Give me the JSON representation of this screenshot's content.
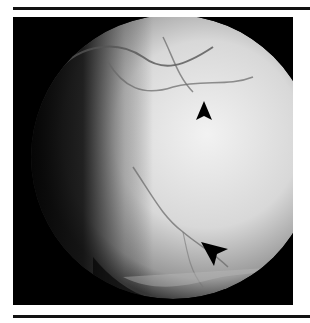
{
  "figure": {
    "type": "grayscale fundus photograph",
    "markers": [
      {
        "name": "arrowhead-upper",
        "direction": "up",
        "x": 204,
        "y": 104
      },
      {
        "name": "arrowhead-lower",
        "direction": "down-right",
        "x": 214,
        "y": 250
      }
    ],
    "colors": {
      "background": "#000000",
      "fundus_light": "#e6e6e6",
      "vessel": "#5a5a5a",
      "rule": "#111111"
    }
  }
}
